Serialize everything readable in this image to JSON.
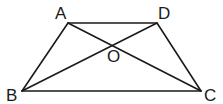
{
  "figure": {
    "type": "trapezoid-with-diagonals",
    "points": [
      {
        "id": "A",
        "label": "A"
      },
      {
        "id": "D",
        "label": "D"
      },
      {
        "id": "B",
        "label": "B"
      },
      {
        "id": "C",
        "label": "C"
      },
      {
        "id": "O",
        "label": "O"
      }
    ],
    "segments": [
      {
        "name": "AD",
        "from": "A",
        "to": "D"
      },
      {
        "name": "BC",
        "from": "B",
        "to": "C"
      },
      {
        "name": "AB",
        "from": "A",
        "to": "B"
      },
      {
        "name": "DC",
        "from": "D",
        "to": "C"
      },
      {
        "name": "AC",
        "from": "A",
        "to": "C"
      },
      {
        "name": "BD",
        "from": "B",
        "to": "D"
      }
    ],
    "intersection": {
      "point": "O",
      "of": [
        "AC",
        "BD"
      ]
    },
    "colors": {
      "stroke": "#1a1a1a",
      "background": "#ffffff"
    }
  }
}
